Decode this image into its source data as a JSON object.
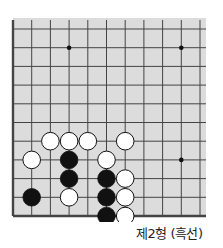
{
  "diagram": {
    "type": "go-board-problem",
    "caption": "제2형 (흑선)",
    "board_colors": {
      "fill": "#dcdcdc",
      "line": "#444444",
      "black_stone": "#111111",
      "white_stone": "#ffffff"
    },
    "visible_region": {
      "columns": 11,
      "rows": 11,
      "edges": [
        "left",
        "bottom"
      ]
    },
    "star_points": [
      {
        "col": 3,
        "row": 1
      },
      {
        "col": 9,
        "row": 1
      },
      {
        "col": 9,
        "row": 7
      }
    ],
    "stones": [
      {
        "color": "white",
        "col": 2,
        "row": 6
      },
      {
        "color": "white",
        "col": 3,
        "row": 6
      },
      {
        "color": "white",
        "col": 4,
        "row": 6
      },
      {
        "color": "white",
        "col": 6,
        "row": 6
      },
      {
        "color": "white",
        "col": 1,
        "row": 7
      },
      {
        "color": "black",
        "col": 3,
        "row": 7
      },
      {
        "color": "white",
        "col": 5,
        "row": 7
      },
      {
        "color": "black",
        "col": 3,
        "row": 8
      },
      {
        "color": "black",
        "col": 5,
        "row": 8
      },
      {
        "color": "white",
        "col": 6,
        "row": 8
      },
      {
        "color": "black",
        "col": 1,
        "row": 9
      },
      {
        "color": "white",
        "col": 3,
        "row": 9
      },
      {
        "color": "black",
        "col": 5,
        "row": 9
      },
      {
        "color": "white",
        "col": 6,
        "row": 9
      },
      {
        "color": "black",
        "col": 5,
        "row": 10
      },
      {
        "color": "white",
        "col": 6,
        "row": 10
      }
    ]
  }
}
